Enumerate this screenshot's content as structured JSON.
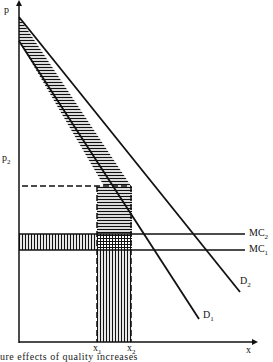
{
  "diagram": {
    "axes": {
      "y_label": "p",
      "x_label": "x"
    },
    "price_labels": {
      "p2": "p",
      "p2_sub": "2"
    },
    "quantity_labels": [
      {
        "main": "x",
        "sub": "1"
      },
      {
        "main": "x",
        "sub": "2"
      }
    ],
    "curves": [
      {
        "main": "D",
        "sub": "1",
        "type": "demand"
      },
      {
        "main": "D",
        "sub": "2",
        "type": "demand"
      },
      {
        "main": "MC",
        "sub": "1",
        "type": "marginal-cost"
      },
      {
        "main": "MC",
        "sub": "2",
        "type": "marginal-cost"
      }
    ],
    "caption": "ure effects of quality increases",
    "colors": {
      "ink": "#111111",
      "background": "#ffffff"
    }
  }
}
